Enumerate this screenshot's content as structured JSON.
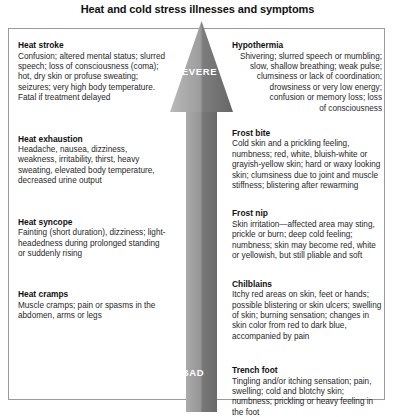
{
  "title": "Heat and cold stress illnesses and symptoms",
  "arrow": {
    "top_label": "SEVERE",
    "bottom_label": "BAD",
    "direction": "up",
    "color_light": "#b8b8b8",
    "color_dark": "#6f6f6f"
  },
  "left_column": {
    "heading": "Heat illnesses",
    "blocks": [
      {
        "title": "Heat stroke",
        "body": "Confusion; altered mental status; slurred speech; loss of consciousness (coma); hot, dry skin or profuse sweating; seizures; very high body temperature. Fatal if treatment delayed"
      },
      {
        "title": "Heat exhaustion",
        "body": "Headache, nausea, dizziness, weakness, irritability, thirst, heavy sweating, elevated body temperature, decreased urine output"
      },
      {
        "title": "Heat syncope",
        "body": "Fainting (short duration), dizziness; light-headedness during prolonged standing or suddenly rising"
      },
      {
        "title": "Heat cramps",
        "body": "Muscle cramps; pain or spasms in the abdomen, arms or legs"
      }
    ]
  },
  "right_column": {
    "heading": "Cold illnesses",
    "blocks": [
      {
        "title": "Hypothermia",
        "body": "Shivering; slurred speech or mumbling; slow, shallow breathing; weak pulse; clumsiness or lack of coordination; drowsiness or very low energy; confusion or memory loss; loss of consciousness",
        "lines": [
          "Shivering; slurred speech or mumbling;",
          "slow, shallow breathing; weak pulse;",
          "clumsiness or lack of coordination;",
          "drowsiness or very low energy;",
          "confusion or memory loss; loss",
          "of consciousness"
        ]
      },
      {
        "title": "Frost bite",
        "body": "Cold skin and a prickling feeling, numbness; red, white, bluish-white or grayish-yellow skin; hard or waxy looking skin; clumsiness due to joint and muscle stiffness; blistering after rewarming"
      },
      {
        "title": "Frost nip",
        "body": "Skin irritation—affected area may sting, prickle or burn; deep cold feeling; numbness; skin may become red, white or yellowish, but still pliable and soft"
      },
      {
        "title": "Chilblains",
        "body": "Itchy red areas on skin, feet or hands; possible blistering or skin ulcers; swelling of skin; burning sensation; changes in skin color from red to dark blue, accompanied by pain"
      },
      {
        "title": "Trench foot",
        "body": "Tingling and/or itching sensation; pain, swelling; cold and blotchy skin; numbness; prickling or heavy feeling in the foot"
      }
    ]
  }
}
